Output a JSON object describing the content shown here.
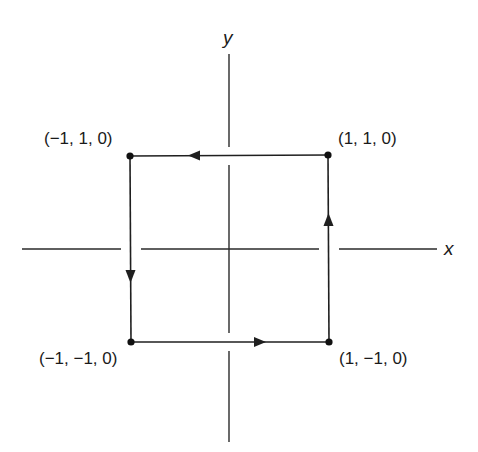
{
  "diagram": {
    "type": "closed-path-in-xy-plane",
    "axes": {
      "x_label": "x",
      "y_label": "y"
    },
    "vertices": [
      {
        "id": "top-left",
        "label": "(−1, 1, 0)",
        "coords": [
          -1,
          1,
          0
        ]
      },
      {
        "id": "top-right",
        "label": "(1, 1, 0)",
        "coords": [
          1,
          1,
          0
        ]
      },
      {
        "id": "bottom-left",
        "label": "(−1, −1, 0)",
        "coords": [
          -1,
          -1,
          0
        ]
      },
      {
        "id": "bottom-right",
        "label": "(1, −1, 0)",
        "coords": [
          1,
          -1,
          0
        ]
      }
    ],
    "edges": [
      {
        "from": "bottom-left",
        "to": "bottom-right",
        "direction": "right"
      },
      {
        "from": "bottom-right",
        "to": "top-right",
        "direction": "up"
      },
      {
        "from": "top-right",
        "to": "top-left",
        "direction": "left"
      },
      {
        "from": "top-left",
        "to": "bottom-left",
        "direction": "down"
      }
    ],
    "orientation": "counterclockwise",
    "colors": {
      "line": "#1f1f1f",
      "background": "#ffffff"
    }
  }
}
